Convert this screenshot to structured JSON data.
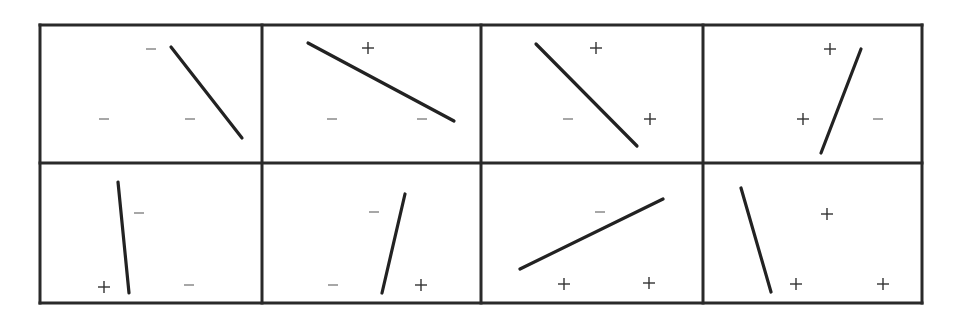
{
  "figure": {
    "colors": {
      "background": "#ffffff",
      "grid": "#2a2a2a",
      "line": "#222222",
      "plus": "#333333",
      "minus": "#777777"
    },
    "grid": {
      "x": [
        40,
        262,
        481,
        703,
        922
      ],
      "y": [
        25,
        163,
        303
      ],
      "stroke_width": 3
    },
    "panels": [
      {
        "row": 0,
        "col": 0,
        "line": {
          "x1": 171,
          "y1": 47,
          "x2": 242,
          "y2": 138
        },
        "markers": [
          {
            "sign": "-",
            "x": 151,
            "y": 49
          },
          {
            "sign": "-",
            "x": 104,
            "y": 119
          },
          {
            "sign": "-",
            "x": 190,
            "y": 119
          }
        ]
      },
      {
        "row": 0,
        "col": 1,
        "line": {
          "x1": 308,
          "y1": 43,
          "x2": 454,
          "y2": 121
        },
        "markers": [
          {
            "sign": "+",
            "x": 368,
            "y": 48
          },
          {
            "sign": "-",
            "x": 332,
            "y": 119
          },
          {
            "sign": "-",
            "x": 422,
            "y": 119
          }
        ]
      },
      {
        "row": 0,
        "col": 2,
        "line": {
          "x1": 536,
          "y1": 44,
          "x2": 637,
          "y2": 146
        },
        "markers": [
          {
            "sign": "+",
            "x": 596,
            "y": 48
          },
          {
            "sign": "-",
            "x": 568,
            "y": 119
          },
          {
            "sign": "+",
            "x": 650,
            "y": 119
          }
        ]
      },
      {
        "row": 0,
        "col": 3,
        "line": {
          "x1": 861,
          "y1": 49,
          "x2": 821,
          "y2": 153
        },
        "markers": [
          {
            "sign": "+",
            "x": 830,
            "y": 49
          },
          {
            "sign": "+",
            "x": 803,
            "y": 119
          },
          {
            "sign": "-",
            "x": 878,
            "y": 119
          }
        ]
      },
      {
        "row": 1,
        "col": 0,
        "line": {
          "x1": 118,
          "y1": 182,
          "x2": 129,
          "y2": 293
        },
        "markers": [
          {
            "sign": "-",
            "x": 139,
            "y": 213
          },
          {
            "sign": "+",
            "x": 104,
            "y": 287
          },
          {
            "sign": "-",
            "x": 189,
            "y": 285
          }
        ]
      },
      {
        "row": 1,
        "col": 1,
        "line": {
          "x1": 405,
          "y1": 194,
          "x2": 382,
          "y2": 293
        },
        "markers": [
          {
            "sign": "-",
            "x": 374,
            "y": 212
          },
          {
            "sign": "-",
            "x": 333,
            "y": 285
          },
          {
            "sign": "+",
            "x": 421,
            "y": 285
          }
        ]
      },
      {
        "row": 1,
        "col": 2,
        "line": {
          "x1": 520,
          "y1": 269,
          "x2": 663,
          "y2": 199
        },
        "markers": [
          {
            "sign": "-",
            "x": 600,
            "y": 212
          },
          {
            "sign": "+",
            "x": 564,
            "y": 284
          },
          {
            "sign": "+",
            "x": 649,
            "y": 283
          }
        ]
      },
      {
        "row": 1,
        "col": 3,
        "line": {
          "x1": 741,
          "y1": 188,
          "x2": 771,
          "y2": 292
        },
        "markers": [
          {
            "sign": "+",
            "x": 827,
            "y": 214
          },
          {
            "sign": "+",
            "x": 796,
            "y": 284
          },
          {
            "sign": "+",
            "x": 883,
            "y": 284
          }
        ]
      }
    ]
  }
}
